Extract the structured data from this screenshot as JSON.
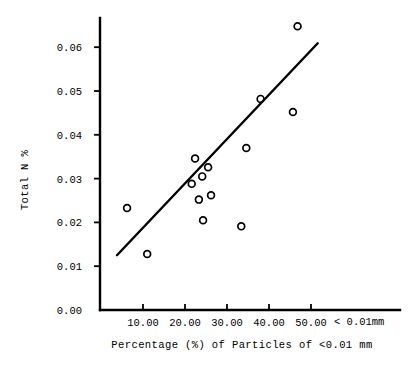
{
  "chart_data": {
    "type": "scatter",
    "title": "",
    "xlabel": "Percentage (%) of Particles of <0.01 mm",
    "ylabel": "Total N %",
    "x_axis_note": "< 0.01mm",
    "xlim": [
      -0.2,
      61.0
    ],
    "ylim": [
      0.0,
      0.0675
    ],
    "grid": false,
    "legend": "none",
    "x_ticks": [
      "10.00",
      "20.00",
      "30.00",
      "40.00",
      "50.00"
    ],
    "x_tick_values": [
      10,
      20,
      30,
      40,
      50
    ],
    "y_ticks": [
      "0.00",
      "0.01",
      "0.02",
      "0.03",
      "0.04",
      "0.05",
      "0.06"
    ],
    "y_tick_values": [
      0.0,
      0.01,
      0.02,
      0.03,
      0.04,
      0.05,
      0.06
    ],
    "points": [
      {
        "x": 6.2,
        "y": 0.0233
      },
      {
        "x": 11.0,
        "y": 0.0128
      },
      {
        "x": 21.6,
        "y": 0.0288
      },
      {
        "x": 22.4,
        "y": 0.0346
      },
      {
        "x": 23.3,
        "y": 0.0252
      },
      {
        "x": 24.1,
        "y": 0.0305
      },
      {
        "x": 24.3,
        "y": 0.0205
      },
      {
        "x": 25.5,
        "y": 0.0326
      },
      {
        "x": 26.2,
        "y": 0.0262
      },
      {
        "x": 33.4,
        "y": 0.0191
      },
      {
        "x": 34.6,
        "y": 0.037
      },
      {
        "x": 38.0,
        "y": 0.0482
      },
      {
        "x": 45.7,
        "y": 0.0452
      },
      {
        "x": 46.8,
        "y": 0.0648
      }
    ],
    "fit_line": {
      "label": "regression-line",
      "x1": 3.8,
      "y1": 0.0125,
      "x2": 51.6,
      "y2": 0.0609
    }
  }
}
